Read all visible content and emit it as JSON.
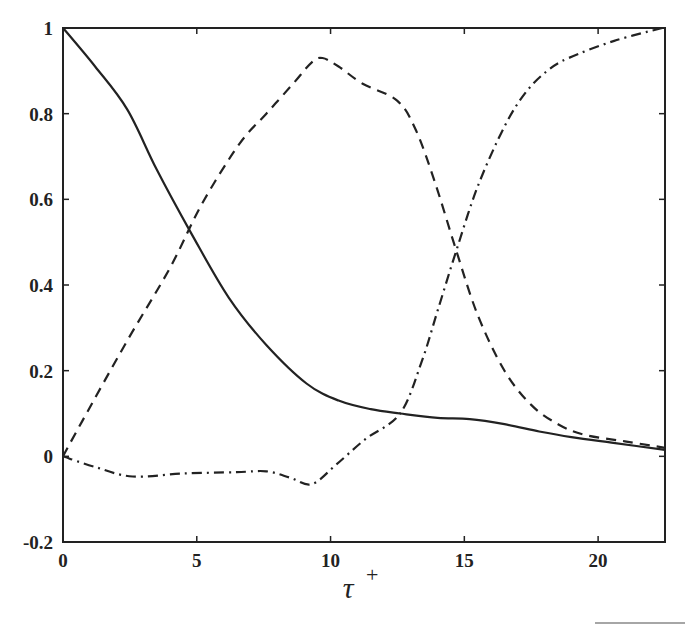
{
  "chart_data": {
    "type": "line",
    "title": "",
    "xlabel": "τ+",
    "xlabel_main": "τ",
    "xlabel_sup": "+",
    "ylabel": "",
    "xlim": [
      0,
      22.5
    ],
    "ylim": [
      -0.2,
      1.0
    ],
    "xticks": [
      0,
      5,
      10,
      15,
      20
    ],
    "xtick_labels": [
      "0",
      "5",
      "10",
      "15",
      "20"
    ],
    "yticks": [
      -0.2,
      0,
      0.2,
      0.4,
      0.6,
      0.8,
      1.0
    ],
    "ytick_labels": [
      "-0.2",
      "0",
      "0.2",
      "0.4",
      "0.6",
      "0.8",
      "1"
    ],
    "grid": false,
    "legend": null,
    "series": [
      {
        "name": "solid",
        "style": "solid",
        "x": [
          0,
          1.2,
          2.4,
          3.5,
          4.8,
          6.2,
          7.6,
          9.1,
          10.3,
          11.5,
          12.6,
          14.0,
          15.2,
          16.5,
          17.8,
          19.0,
          20.5,
          22.5
        ],
        "y": [
          1.0,
          0.91,
          0.81,
          0.67,
          0.52,
          0.37,
          0.26,
          0.17,
          0.13,
          0.11,
          0.1,
          0.09,
          0.087,
          0.075,
          0.058,
          0.045,
          0.032,
          0.015
        ]
      },
      {
        "name": "dashed",
        "style": "dashed",
        "x": [
          0,
          0.7,
          2.4,
          4.0,
          5.2,
          6.6,
          7.6,
          8.6,
          9.3,
          9.7,
          10.3,
          11.2,
          12.5,
          13.2,
          13.9,
          14.7,
          15.5,
          16.5,
          17.5,
          18.5,
          19.5,
          21.0,
          22.5
        ],
        "y": [
          0.0,
          0.08,
          0.27,
          0.44,
          0.59,
          0.73,
          0.8,
          0.87,
          0.92,
          0.93,
          0.91,
          0.87,
          0.83,
          0.76,
          0.64,
          0.48,
          0.33,
          0.2,
          0.12,
          0.075,
          0.05,
          0.035,
          0.02
        ]
      },
      {
        "name": "dash-dot",
        "style": "dashdot",
        "x": [
          0,
          1.2,
          2.6,
          4.5,
          6.5,
          7.6,
          8.5,
          9.3,
          10.2,
          11.3,
          12.6,
          13.4,
          14.0,
          14.7,
          15.5,
          16.5,
          17.3,
          18.1,
          18.9,
          20.6,
          22.4
        ],
        "y": [
          0.0,
          -0.025,
          -0.047,
          -0.04,
          -0.037,
          -0.035,
          -0.05,
          -0.065,
          -0.02,
          0.04,
          0.1,
          0.22,
          0.34,
          0.48,
          0.63,
          0.77,
          0.85,
          0.9,
          0.93,
          0.97,
          1.0
        ]
      }
    ],
    "annotations": []
  }
}
